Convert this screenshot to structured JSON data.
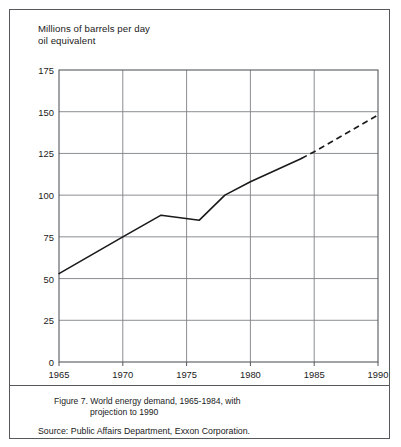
{
  "figure": {
    "caption_label": "Figure 7.",
    "caption_line1": "World energy demand, 1965-1984, with",
    "caption_line2": "projection to 1990",
    "source_label": "Source:",
    "source_text": "Public Affairs Department, Exxon Corporation."
  },
  "axis_title_line1": "Millions of barrels per day",
  "axis_title_line2": "oil equivalent",
  "colors": {
    "line": "#1a1a1a",
    "grid": "#7d8184",
    "frame": "#55595c",
    "background": "#ffffff"
  },
  "chart_data": {
    "type": "line",
    "title": "World energy demand, 1965-1984, with projection to 1990",
    "xlabel": "",
    "ylabel": "Millions of barrels per day oil equivalent",
    "xlim": [
      1965,
      1990
    ],
    "ylim": [
      0,
      175
    ],
    "xticks": [
      1965,
      1970,
      1975,
      1980,
      1985,
      1990
    ],
    "yticks": [
      0,
      25,
      50,
      75,
      100,
      125,
      150,
      175
    ],
    "grid": true,
    "legend": "none",
    "series": [
      {
        "name": "Historical world energy demand",
        "style": "solid",
        "x": [
          1965,
          1970,
          1973,
          1976,
          1978,
          1980,
          1984
        ],
        "values": [
          53,
          75,
          88,
          85,
          100,
          108,
          122
        ]
      },
      {
        "name": "Projection to 1990",
        "style": "dashed",
        "x": [
          1984,
          1985,
          1990
        ],
        "values": [
          122,
          126,
          148
        ]
      }
    ]
  }
}
